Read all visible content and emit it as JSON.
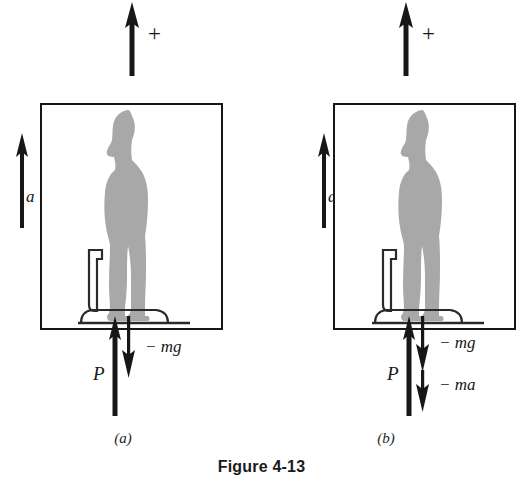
{
  "figure": {
    "caption": "Figure 4-13",
    "colors": {
      "ink": "#171717",
      "silhouette_gray": "#a8a8a8",
      "background": "#ffffff"
    }
  },
  "panels": [
    {
      "letter": "(a)",
      "reference_arrow": {
        "icon": "up-arrow-icon",
        "plus_sign": "+",
        "direction": "up"
      },
      "acceleration": {
        "icon": "up-arrow-icon",
        "label": "a",
        "direction": "up"
      },
      "elevator": {
        "name": "elevator-box",
        "occupant": "person-silhouette",
        "instrument": "bathroom-scale"
      },
      "force_vectors": [
        {
          "label": "P",
          "direction": "up",
          "icon": "up-arrow-icon"
        },
        {
          "label": "− mg",
          "direction": "down",
          "icon": "down-arrow-icon"
        }
      ]
    },
    {
      "letter": "(b)",
      "reference_arrow": {
        "icon": "up-arrow-icon",
        "plus_sign": "+",
        "direction": "up"
      },
      "acceleration": {
        "icon": "up-arrow-icon",
        "label": "a",
        "direction": "up"
      },
      "elevator": {
        "name": "elevator-box",
        "occupant": "person-silhouette",
        "instrument": "bathroom-scale"
      },
      "force_vectors": [
        {
          "label": "P",
          "direction": "up",
          "icon": "up-arrow-icon"
        },
        {
          "label": "− mg",
          "direction": "down",
          "icon": "down-arrow-icon"
        },
        {
          "label": "− ma",
          "direction": "down",
          "icon": "down-arrow-icon"
        }
      ]
    }
  ]
}
